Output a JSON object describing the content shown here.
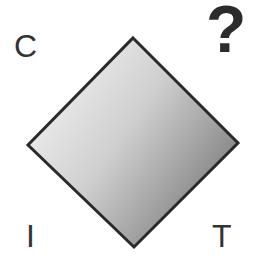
{
  "figure": {
    "background_color": "#ffffff",
    "width": 263,
    "height": 261
  },
  "shape": {
    "name": "diamond",
    "type": "rhombus",
    "vertices": {
      "top": [
        133,
        38
      ],
      "right": [
        238,
        143
      ],
      "bottom": [
        134,
        247
      ],
      "left": [
        28,
        145
      ]
    },
    "border_color": "#2a2a2a",
    "border_width": 3,
    "fill": {
      "type": "linear-gradient",
      "direction": "left-to-right, light to dark",
      "stops": [
        {
          "offset": 0.0,
          "color": "#fbfbfb"
        },
        {
          "offset": 0.22,
          "color": "#e3e3e3"
        },
        {
          "offset": 0.45,
          "color": "#cfcfcf"
        },
        {
          "offset": 0.68,
          "color": "#a8a8a8"
        },
        {
          "offset": 1.0,
          "color": "#6e6e6e"
        }
      ]
    }
  },
  "labels": {
    "top_left": "C",
    "bottom_left": "I",
    "bottom_right": "T",
    "top_right": "?",
    "top_right_icon_name": "question-mark-icon"
  }
}
